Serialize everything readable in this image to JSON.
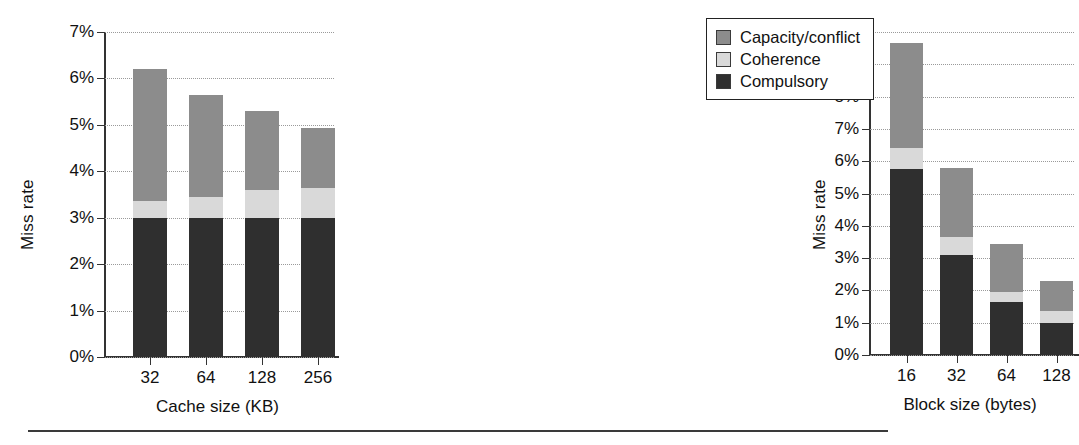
{
  "legend": {
    "entries": [
      {
        "label": "Capacity/conflict",
        "color": "#8c8c8c",
        "key": "capacity"
      },
      {
        "label": "Coherence",
        "color": "#d9d9d9",
        "key": "coherence"
      },
      {
        "label": "Compulsory",
        "color": "#2f2f2f",
        "key": "compulsory"
      }
    ]
  },
  "chart_data": [
    {
      "id": "cache-size-chart",
      "type": "bar",
      "stacked": true,
      "title": "",
      "xlabel": "Cache size (KB)",
      "ylabel": "Miss rate",
      "categories": [
        "32",
        "64",
        "128",
        "256"
      ],
      "ylim": [
        0,
        7
      ],
      "ytick_values": [
        0,
        1,
        2,
        3,
        4,
        5,
        6,
        7
      ],
      "ytick_labels": [
        "0%",
        "1%",
        "2%",
        "3%",
        "4%",
        "5%",
        "6%",
        "7%"
      ],
      "grid": true,
      "series": [
        {
          "name": "Compulsory",
          "key": "compulsory",
          "color": "#2f2f2f",
          "values": [
            3.0,
            3.0,
            3.0,
            3.0
          ]
        },
        {
          "name": "Coherence",
          "key": "coherence",
          "color": "#d9d9d9",
          "values": [
            0.35,
            0.45,
            0.6,
            0.65
          ]
        },
        {
          "name": "Capacity/conflict",
          "key": "capacity",
          "color": "#8c8c8c",
          "values": [
            2.85,
            2.2,
            1.7,
            1.28
          ]
        }
      ],
      "totals": [
        6.2,
        5.65,
        5.3,
        4.93
      ]
    },
    {
      "id": "block-size-chart",
      "type": "bar",
      "stacked": true,
      "title": "",
      "xlabel": "Block size (bytes)",
      "ylabel": "Miss rate",
      "categories": [
        "16",
        "32",
        "64",
        "128"
      ],
      "ylim": [
        0,
        10
      ],
      "ytick_values": [
        0,
        1,
        2,
        3,
        4,
        5,
        6,
        7,
        8,
        9,
        10
      ],
      "ytick_labels": [
        "0%",
        "1%",
        "2%",
        "3%",
        "4%",
        "5%",
        "6%",
        "7%",
        "8%",
        "9%",
        "10%"
      ],
      "grid": true,
      "series": [
        {
          "name": "Compulsory",
          "key": "compulsory",
          "color": "#2f2f2f",
          "values": [
            5.75,
            3.1,
            1.65,
            1.0
          ]
        },
        {
          "name": "Coherence",
          "key": "coherence",
          "color": "#d9d9d9",
          "values": [
            0.65,
            0.55,
            0.3,
            0.35
          ]
        },
        {
          "name": "Capacity/conflict",
          "key": "capacity",
          "color": "#8c8c8c",
          "values": [
            3.25,
            2.15,
            1.5,
            0.95
          ]
        }
      ],
      "totals": [
        9.65,
        5.8,
        3.45,
        2.3
      ]
    }
  ]
}
